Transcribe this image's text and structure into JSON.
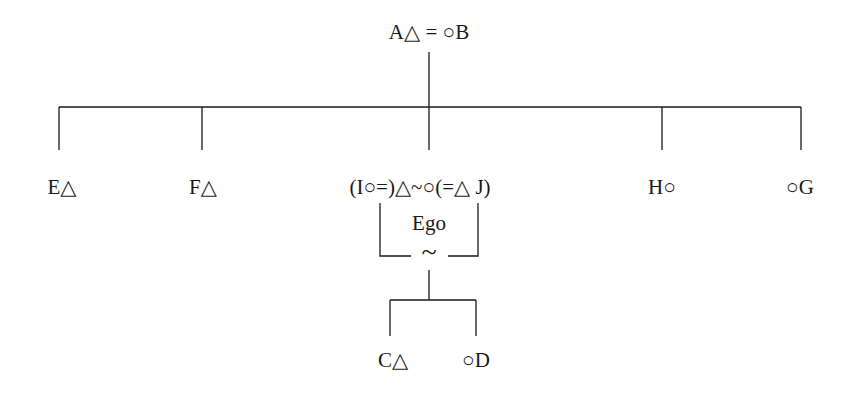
{
  "diagram": {
    "type": "kinship-chart",
    "colors": {
      "line": "#1a1a1a",
      "text": "#1a1a1a",
      "background": "#ffffff"
    },
    "nodes": {
      "parents": "A△ = ○B",
      "child_e": "E△",
      "child_f": "F△",
      "ego_couple": "(I○=)△~○(=△ J)",
      "child_h": "H○",
      "child_g": "○G",
      "ego_label": "Ego",
      "ego_union_symbol": "~",
      "grandchild_c": "C△",
      "grandchild_d": "○D"
    },
    "legend_symbols": {
      "triangle": "male",
      "circle": "female",
      "equals": "marriage",
      "tilde": "non-marital union"
    }
  }
}
